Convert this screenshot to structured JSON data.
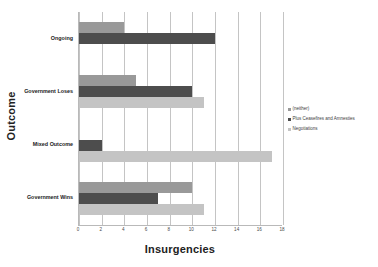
{
  "chart_data": {
    "type": "bar",
    "orientation": "horizontal",
    "title": "",
    "xlabel": "Insurgencies",
    "ylabel": "Outcome",
    "categories": [
      "Ongoing",
      "Government Loses",
      "Mixed Outcome",
      "Government Wins"
    ],
    "series": [
      {
        "name": "(neither)",
        "color": "#999999",
        "values": [
          4,
          5,
          0,
          10
        ]
      },
      {
        "name": "Plus Ceasefires and Amnesties",
        "color": "#4d4d4d",
        "values": [
          12,
          10,
          2,
          7
        ]
      },
      {
        "name": "Negotiations",
        "color": "#c4c4c4",
        "values": [
          0,
          11,
          17,
          11
        ]
      }
    ],
    "xlim": [
      0,
      18
    ],
    "xticks": [
      0,
      2,
      4,
      6,
      8,
      10,
      12,
      14,
      16,
      18
    ],
    "xtick_labels": [
      "0",
      "2",
      "4",
      "6",
      "8",
      "10",
      "12",
      "14",
      "16",
      "18"
    ],
    "grid": true,
    "grid_axis": "x",
    "legend_position": "right",
    "legend_entries": [
      "(neither)",
      "Plus Ceasefires and Amnesties",
      "Negotiations"
    ]
  },
  "axes": {
    "x_title": "Insurgencies",
    "y_title": "Outcome"
  },
  "colors": {
    "neither": "#999999",
    "ceasefires": "#4d4d4d",
    "negotiations": "#c4c4c4",
    "gridline": "#c4c4c4",
    "axis": "#b9b9b9",
    "background": "#ffffff"
  }
}
